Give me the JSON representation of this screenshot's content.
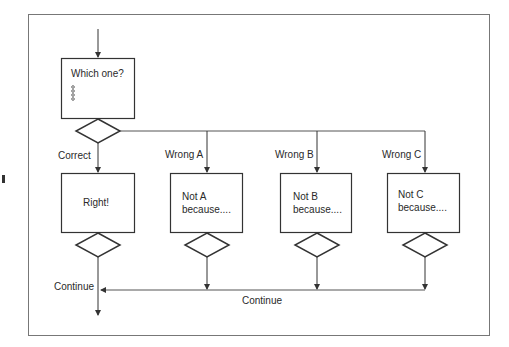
{
  "diagram": {
    "type": "flowchart",
    "start_box": {
      "title": "Which one?",
      "options_marker": "4 small circles (options list)"
    },
    "branches": [
      {
        "label": "Correct",
        "box_text": [
          "Right!"
        ]
      },
      {
        "label": "Wrong A",
        "box_text": [
          "Not A",
          "because...."
        ]
      },
      {
        "label": "Wrong B",
        "box_text": [
          "Not B",
          "because...."
        ]
      },
      {
        "label": "Wrong C",
        "box_text": [
          "Not C",
          "because...."
        ]
      }
    ],
    "merge_labels": {
      "left": "Continue",
      "bottom": "Continue"
    },
    "colors": {
      "stroke": "#333333",
      "frame": "#777777",
      "text": "#2a2a2a",
      "background": "#ffffff"
    }
  }
}
